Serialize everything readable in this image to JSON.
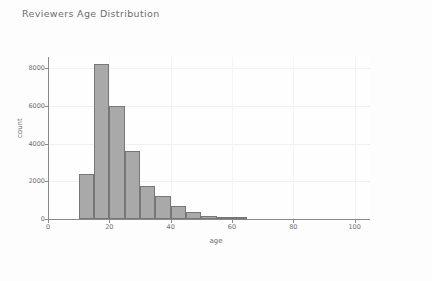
{
  "figure": {
    "title": "Reviewers Age Distribution",
    "background_color": "#fdfdfd",
    "bar_fill_color": "#a9a9a9",
    "bar_edge_color": "#777777",
    "axis_color": "#8a8a8a",
    "text_color": "#6f6f6f"
  },
  "chart_data": {
    "type": "bar",
    "title": "Reviewers Age Distribution",
    "xlabel": "age",
    "ylabel": "count",
    "xlim": [
      0,
      105
    ],
    "ylim": [
      0,
      8600
    ],
    "grid": true,
    "legend": null,
    "bin_width": 5,
    "categories": [
      "10-15",
      "15-20",
      "20-25",
      "25-30",
      "30-35",
      "35-40",
      "40-45",
      "45-50",
      "50-55",
      "55-60",
      "60-65"
    ],
    "bin_starts": [
      10,
      15,
      20,
      25,
      30,
      35,
      40,
      45,
      50,
      55,
      60
    ],
    "values": [
      2400,
      8250,
      6000,
      3600,
      1750,
      1200,
      700,
      350,
      150,
      60,
      20
    ],
    "xticks": [
      0,
      20,
      40,
      60,
      80,
      100
    ],
    "xtick_labels": [
      "0",
      "20",
      "40",
      "60",
      "80",
      "100"
    ],
    "yticks": [
      0,
      2000,
      4000,
      6000,
      8000
    ],
    "ytick_labels": [
      "0",
      "2000",
      "4000",
      "6000",
      "8000"
    ]
  }
}
